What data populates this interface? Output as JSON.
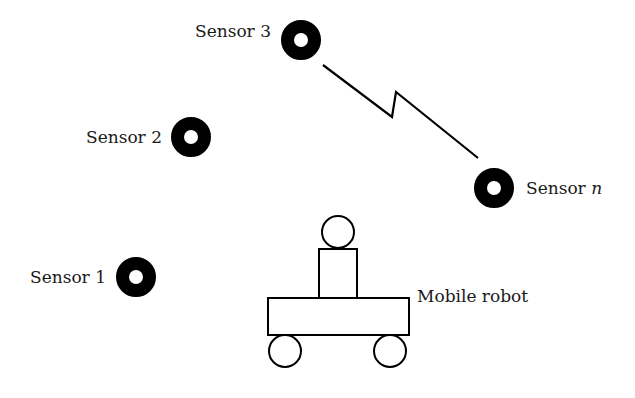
{
  "diagram": {
    "sensors": [
      {
        "label": "Sensor 1",
        "cx": 136,
        "cy": 277
      },
      {
        "label": "Sensor 2",
        "cx": 191,
        "cy": 137
      },
      {
        "label": "Sensor 3",
        "cx": 301,
        "cy": 40
      },
      {
        "label_prefix": "Sensor ",
        "label_italic": "n",
        "cx": 494,
        "cy": 188
      }
    ],
    "wireless_link": {
      "from": "Sensor 3",
      "to": "Sensor n",
      "style": "lightning-bolt"
    },
    "robot": {
      "label": "Mobile robot"
    },
    "colors": {
      "ink": "#000000",
      "background": "#ffffff"
    }
  }
}
